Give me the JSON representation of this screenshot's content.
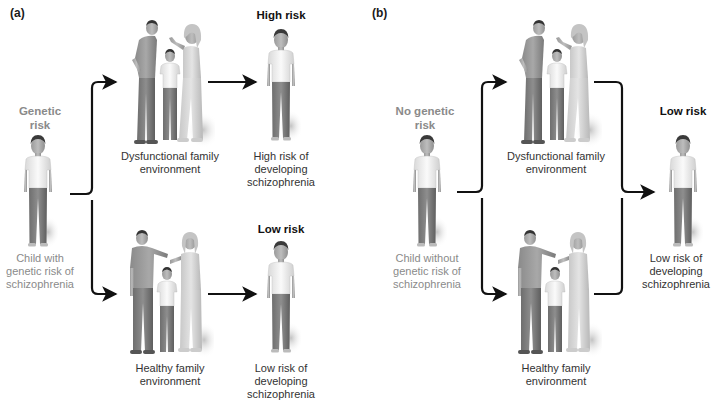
{
  "panels": [
    {
      "label": "(a)",
      "start": {
        "heading": "Genetic risk",
        "caption": "Child with genetic risk of schizophrenia"
      },
      "environments": [
        {
          "caption": "Dysfunctional family environment",
          "type": "dysfunctional"
        },
        {
          "caption": "Healthy family environment",
          "type": "healthy"
        }
      ],
      "outcomes": [
        {
          "heading": "High risk",
          "caption": "High risk of developing schizophrenia"
        },
        {
          "heading": "Low risk",
          "caption": "Low risk of developing schizophrenia"
        }
      ]
    },
    {
      "label": "(b)",
      "start": {
        "heading": "No genetic risk",
        "caption": "Child without genetic risk of schizophrenia"
      },
      "environments": [
        {
          "caption": "Dysfunctional family environment",
          "type": "dysfunctional"
        },
        {
          "caption": "Healthy family environment",
          "type": "healthy"
        }
      ],
      "outcomes": [
        {
          "heading": "Low risk",
          "caption": "Low risk of developing schizophrenia"
        }
      ]
    }
  ],
  "colors": {
    "start_heading": "#8a8a8a",
    "outcome_heading": "#111111",
    "arrow": "#111111"
  }
}
